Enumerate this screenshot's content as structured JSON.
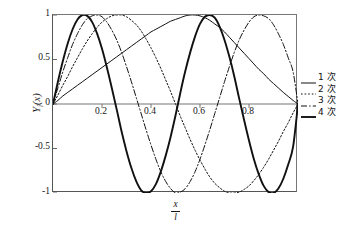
{
  "chart_data": {
    "type": "line",
    "title": "",
    "subtitle": "",
    "xlabel_numerator": "x",
    "xlabel_denominator": "l",
    "ylabel": "Yi(x)",
    "xlim": [
      0,
      1
    ],
    "ylim": [
      -1,
      1
    ],
    "grid": false,
    "legend_position": "right",
    "xticks": [
      0.2,
      0.4,
      0.6,
      0.8
    ],
    "xtick_labels": [
      "0.2",
      "0.4",
      "0.6",
      "0.8"
    ],
    "yticks": [
      1,
      0.5,
      0,
      -0.5,
      -1
    ],
    "ytick_labels": [
      "1",
      "0.5",
      "0",
      "-0.5",
      "-1"
    ],
    "x": [
      0,
      0.02,
      0.04,
      0.06,
      0.08,
      0.1,
      0.12,
      0.14,
      0.16,
      0.18,
      0.2,
      0.22,
      0.24,
      0.26,
      0.28,
      0.3,
      0.32,
      0.34,
      0.36,
      0.38,
      0.4,
      0.42,
      0.44,
      0.46,
      0.48,
      0.5,
      0.52,
      0.54,
      0.56,
      0.58,
      0.6,
      0.62,
      0.64,
      0.66,
      0.68,
      0.7,
      0.72,
      0.74,
      0.76,
      0.78,
      0.8,
      0.82,
      0.84,
      0.86,
      0.88,
      0.9,
      0.92,
      0.94,
      0.96,
      0.98,
      1.0
    ],
    "series": [
      {
        "name": "1 次",
        "order": 1,
        "linestyle": "solid",
        "linewidth": 1.0,
        "color": "#111111",
        "peak_x": [
          0.56
        ],
        "peak_y": [
          1
        ],
        "zeros": [
          0,
          1
        ],
        "values": [
          0,
          0.04,
          0.09,
          0.13,
          0.17,
          0.21,
          0.25,
          0.29,
          0.33,
          0.37,
          0.41,
          0.45,
          0.49,
          0.53,
          0.57,
          0.61,
          0.65,
          0.69,
          0.73,
          0.77,
          0.81,
          0.84,
          0.87,
          0.9,
          0.93,
          0.95,
          0.97,
          0.99,
          1.0,
          1.0,
          0.99,
          0.97,
          0.94,
          0.9,
          0.86,
          0.81,
          0.75,
          0.69,
          0.63,
          0.57,
          0.51,
          0.45,
          0.39,
          0.34,
          0.28,
          0.23,
          0.18,
          0.13,
          0.085,
          0.04,
          0
        ]
      },
      {
        "name": "2 次",
        "order": 2,
        "linestyle": "dotted",
        "linewidth": 1.0,
        "color": "#111111",
        "peak_x": [
          0.27,
          0.75
        ],
        "peak_y": [
          1,
          -1
        ],
        "zeros": [
          0,
          0.5,
          1
        ],
        "values": [
          0,
          0.1,
          0.21,
          0.31,
          0.42,
          0.52,
          0.62,
          0.71,
          0.79,
          0.86,
          0.92,
          0.96,
          0.99,
          1.0,
          1.0,
          0.98,
          0.94,
          0.89,
          0.82,
          0.73,
          0.63,
          0.52,
          0.4,
          0.27,
          0.14,
          0.0,
          -0.14,
          -0.27,
          -0.4,
          -0.52,
          -0.63,
          -0.73,
          -0.82,
          -0.89,
          -0.94,
          -0.98,
          -1.0,
          -1.0,
          -0.99,
          -0.96,
          -0.92,
          -0.86,
          -0.79,
          -0.71,
          -0.62,
          -0.52,
          -0.42,
          -0.31,
          -0.21,
          -0.1,
          0
        ]
      },
      {
        "name": "3 次",
        "order": 3,
        "linestyle": "dashdot",
        "linewidth": 1.0,
        "color": "#111111",
        "peak_x": [
          0.17,
          0.5,
          0.84
        ],
        "peak_y": [
          1,
          -1,
          1
        ],
        "zeros": [
          0,
          0.335,
          0.665,
          1
        ],
        "values": [
          0,
          0.18,
          0.36,
          0.52,
          0.67,
          0.79,
          0.89,
          0.96,
          0.99,
          1.0,
          0.98,
          0.92,
          0.83,
          0.72,
          0.58,
          0.42,
          0.25,
          0.07,
          -0.11,
          -0.29,
          -0.46,
          -0.62,
          -0.76,
          -0.87,
          -0.95,
          -1.0,
          -0.99,
          -0.95,
          -0.87,
          -0.76,
          -0.62,
          -0.46,
          -0.29,
          -0.11,
          0.07,
          0.25,
          0.42,
          0.58,
          0.72,
          0.83,
          0.92,
          0.98,
          1.0,
          0.99,
          0.96,
          0.89,
          0.79,
          0.67,
          0.52,
          0.36,
          0
        ]
      },
      {
        "name": "4 次",
        "order": 4,
        "linestyle": "solid",
        "linewidth": 1.9,
        "color": "#111111",
        "peak_x": [
          0.125,
          0.375,
          0.625,
          0.875
        ],
        "peak_y": [
          1,
          -1,
          1,
          -1
        ],
        "zeros": [
          0,
          0.25,
          0.5,
          0.75,
          1
        ],
        "values": [
          0,
          0.25,
          0.48,
          0.68,
          0.84,
          0.95,
          1.0,
          0.99,
          0.92,
          0.79,
          0.62,
          0.41,
          0.18,
          -0.06,
          -0.31,
          -0.53,
          -0.72,
          -0.87,
          -0.97,
          -1.0,
          -0.98,
          -0.9,
          -0.76,
          -0.58,
          -0.37,
          -0.13,
          0.13,
          0.37,
          0.58,
          0.76,
          0.9,
          0.98,
          1.0,
          0.97,
          0.87,
          0.72,
          0.53,
          0.31,
          0.06,
          -0.18,
          -0.41,
          -0.62,
          -0.79,
          -0.92,
          -0.99,
          -1.0,
          -0.95,
          -0.84,
          -0.68,
          -0.48,
          0
        ]
      }
    ]
  },
  "legend": {
    "items": [
      {
        "label": "1 次",
        "style": "solid-thin"
      },
      {
        "label": "2 次",
        "style": "dotted"
      },
      {
        "label": "3 次",
        "style": "dashdot"
      },
      {
        "label": "4 次",
        "style": "solid-thick"
      }
    ]
  },
  "axes": {
    "y_label_main": "Y",
    "y_label_sub": "i",
    "y_label_arg": "(x)",
    "x_label_num": "x",
    "x_label_den": "l"
  },
  "colors": {
    "line": "#111111",
    "frame": "#666666",
    "zero_axis": "#777777",
    "text": "#141414",
    "background": "#ffffff"
  }
}
